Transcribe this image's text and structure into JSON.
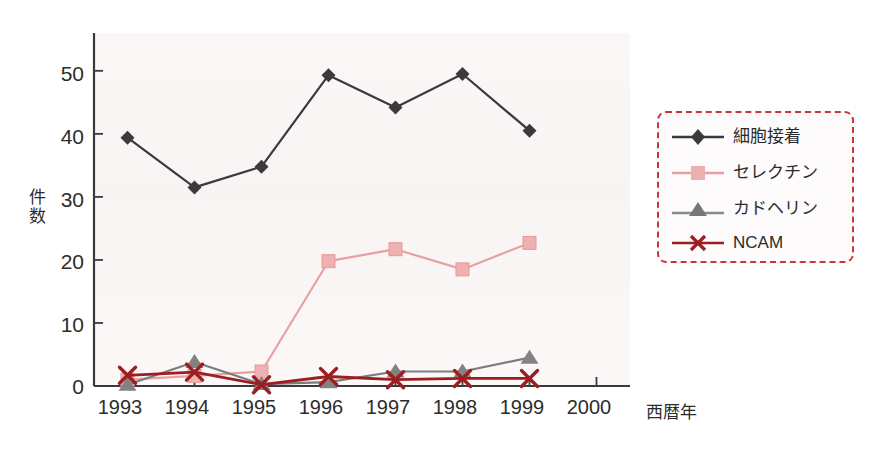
{
  "chart_data": {
    "type": "line",
    "title": "",
    "xlabel": "西暦年",
    "ylabel": "件数",
    "categories": [
      "1993",
      "1994",
      "1995",
      "1996",
      "1997",
      "1998",
      "1999",
      "2000"
    ],
    "x": [
      1993,
      1994,
      1995,
      1996,
      1997,
      1998,
      1999,
      2000
    ],
    "xlim": [
      1992.5,
      2000.5
    ],
    "ylim": [
      0,
      56
    ],
    "yticks": [
      0,
      10,
      20,
      30,
      40,
      50
    ],
    "grid": false,
    "legend_position": "right",
    "series": [
      {
        "name": "細胞接着",
        "marker": "diamond",
        "color": "#3a3a3a",
        "x": [
          1993,
          1994,
          1995,
          1996,
          1997,
          1998,
          1999
        ],
        "values": [
          39.4,
          31.5,
          34.8,
          49.3,
          44.2,
          49.5,
          40.5
        ]
      },
      {
        "name": "セレクチン",
        "marker": "square",
        "color": "#e9a0a0",
        "x": [
          1993,
          1994,
          1995,
          1996,
          1997,
          1998,
          1999
        ],
        "values": [
          1.0,
          1.6,
          2.3,
          19.8,
          21.7,
          18.5,
          22.7
        ]
      },
      {
        "name": "カドヘリン",
        "marker": "triangle",
        "color": "#7c7c7c",
        "x": [
          1993,
          1994,
          1995,
          1996,
          1997,
          1998,
          1999
        ],
        "values": [
          0.2,
          3.8,
          0.3,
          0.6,
          2.3,
          2.3,
          4.5
        ]
      },
      {
        "name": "NCAM",
        "marker": "cross",
        "color": "#9b1f22",
        "x": [
          1993,
          1994,
          1995,
          1996,
          1997,
          1998,
          1999
        ],
        "values": [
          1.7,
          2.2,
          0.2,
          1.5,
          1.0,
          1.2,
          1.2
        ]
      }
    ]
  },
  "axes": {
    "ytick_labels": [
      "50",
      "40",
      "30",
      "20",
      "10",
      "0"
    ],
    "xtick_labels": [
      "1993",
      "1994",
      "1995",
      "1996",
      "1997",
      "1998",
      "1999",
      "2000"
    ],
    "y_axis_title": "件数",
    "x_axis_title": "西暦年"
  },
  "legend": {
    "items": [
      {
        "label": "細胞接着",
        "marker": "diamond",
        "color": "#3a3a3a"
      },
      {
        "label": "セレクチン",
        "marker": "square",
        "color": "#e9a0a0"
      },
      {
        "label": "カドヘリン",
        "marker": "triangle",
        "color": "#7c7c7c"
      },
      {
        "label": "NCAM",
        "marker": "cross",
        "color": "#9b1f22"
      }
    ],
    "border_color": "#c7383c"
  },
  "colors": {
    "plot_background": "#faf6f6",
    "axis": "#3b3b3b",
    "page_background": "#ffffff"
  }
}
